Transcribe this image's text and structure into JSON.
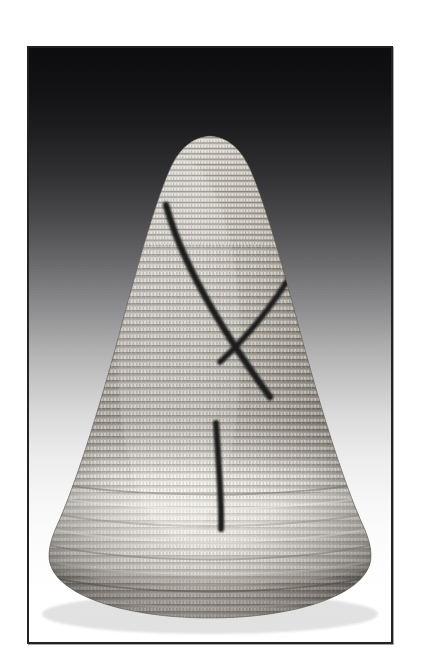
{
  "page": {
    "width": 421,
    "height": 671,
    "background_color": "#ffffff",
    "kind": "scanned-photographic-plate",
    "caption": ""
  },
  "frame": {
    "name": "photo-border",
    "line_color": "#222224",
    "line_width_px": 2,
    "left": 27,
    "top": 46,
    "width": 366,
    "height": 598
  },
  "photo": {
    "subject": "conical coiled basketry hat",
    "medium": "black and white photograph",
    "backdrop": {
      "type": "vertical-gradient",
      "top_color": "#0d0d0f",
      "bottom_color": "#ffffff",
      "description": "studio backdrop fading from near-black at the top to white at the bottom"
    },
    "object": {
      "apex_x": 205,
      "apex_y": 134,
      "base_center_y": 612,
      "base_left_x": 46,
      "base_right_x": 379,
      "body_light": "#e9e6df",
      "body_mid": "#b9b4a9",
      "body_shadow": "#6e6a62",
      "coil_count": 68,
      "coil_spacing_px": 7,
      "lower_band": {
        "top_y": 492,
        "bottom_y": 560,
        "tone": "#efece5",
        "description": "lighter horizontal band of coils near the base"
      },
      "rim_band": {
        "top_y": 560,
        "bottom_y": 614,
        "tone": "#cfc9bf"
      }
    },
    "markings": [
      {
        "name": "left-diagonal-stripe",
        "color": "#1b1b1b",
        "description": "long dark diagonal running from upper-left down to lower-right",
        "start": [
          164,
          203
        ],
        "end": [
          268,
          395
        ]
      },
      {
        "name": "right-diagonal-stripe",
        "color": "#1b1b1b",
        "description": "shorter dark diagonal crossing the first, forming an X",
        "start": [
          299,
          254
        ],
        "end": [
          218,
          360
        ]
      },
      {
        "name": "center-vertical-stripe",
        "color": "#1b1b1b",
        "description": "short dark vertical mark low on the cone, slightly curved",
        "start": [
          214,
          421
        ],
        "end": [
          219,
          527
        ]
      }
    ]
  }
}
